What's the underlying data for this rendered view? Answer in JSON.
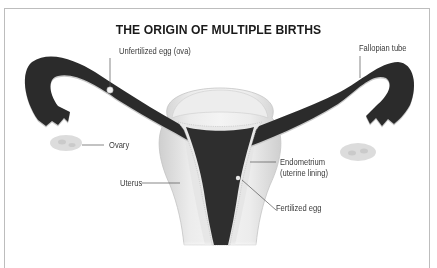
{
  "title": "THE ORIGIN OF MULTIPLE BIRTHS",
  "labels": {
    "unfertilized_egg": "Unfertilized egg (ova)",
    "fallopian_tube": "Fallopian tube",
    "ovary": "Ovary",
    "uterus": "Uterus",
    "endometrium_line1": "Endometrium",
    "endometrium_line2": "(uterine lining)",
    "fertilized_egg": "Fertilized egg"
  },
  "colors": {
    "tube_dark": "#2b2b2b",
    "tissue_light": "#e6e6e6",
    "tissue_mid": "#d2d2d2",
    "ovary": "#d9d9d9",
    "leader_line": "#555555",
    "border": "#bdbdbd"
  }
}
